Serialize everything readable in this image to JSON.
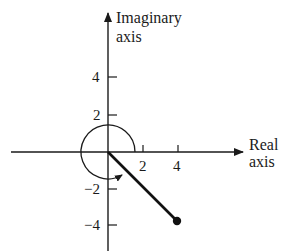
{
  "diagram": {
    "type": "complex-plane",
    "axes": {
      "x_label_line1": "Real",
      "x_label_line2": "axis",
      "y_label_line1": "Imaginary",
      "y_label_line2": "axis"
    },
    "x_ticks": [
      {
        "value": 2,
        "label": "2"
      },
      {
        "value": 4,
        "label": "4"
      }
    ],
    "y_ticks": [
      {
        "value": 4,
        "label": "4"
      },
      {
        "value": 2,
        "label": "2"
      },
      {
        "value": -2,
        "label": "−2"
      },
      {
        "value": -4,
        "label": "−4"
      }
    ],
    "point": {
      "re": 4,
      "im": -4
    },
    "modulus_segment": {
      "from": [
        0,
        0
      ],
      "to": [
        4,
        -4
      ]
    },
    "argument_arc": {
      "radius_units": 1.5,
      "direction": "counterclockwise",
      "start_angle_deg": 0,
      "end_angle_deg": 315
    },
    "colors": {
      "ink": "#1a1a1a",
      "background": "#ffffff"
    }
  }
}
